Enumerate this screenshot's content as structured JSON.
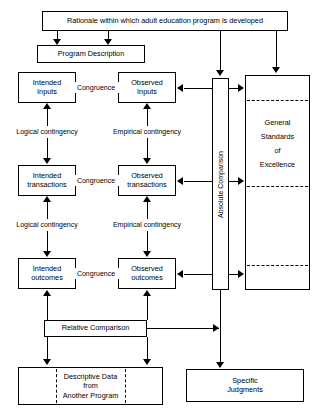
{
  "diagram": {
    "title": "Rationale within which adult education program is developed",
    "nodes": {
      "rationale": "Rationale within which adult education program is developed",
      "program_description": "Program Description",
      "intended_inputs_l1": "Intended",
      "intended_inputs_l2": "Inputs",
      "observed_inputs_l1": "Observed",
      "observed_inputs_l2": "Inputs",
      "intended_transactions_l1": "Intended",
      "intended_transactions_l2": "transactions",
      "observed_transactions_l1": "Observed",
      "observed_transactions_l2": "transactions",
      "intended_outcomes_l1": "Intended",
      "intended_outcomes_l2": "outcomes",
      "observed_outcomes_l1": "Observed",
      "observed_outcomes_l2": "outcomes",
      "absolute_comparison": "Absolute Comparison",
      "standards_l1": "General",
      "standards_l2": "Standards",
      "standards_l3": "of",
      "standards_l4": "Excellence",
      "relative_comparison": "Relative Comparison",
      "descriptive_l1": "Descriptive Data",
      "descriptive_l2": "from",
      "descriptive_l3": "Another Program",
      "specific_judgments_l1": "Specific",
      "specific_judgments_l2": "Judgments"
    },
    "edge_labels": {
      "congruence_1": "Congruence",
      "congruence_2": "Congruence",
      "congruence_3": "Congruence",
      "logical_contingency_1": "Logical contingency",
      "logical_contingency_2": "Logical contingency",
      "empirical_contingency_1": "Empirical contingency",
      "empirical_contingency_2": "Empirical contingency"
    },
    "colors": {
      "stroke": "#000000",
      "fill": "#ffffff"
    }
  }
}
